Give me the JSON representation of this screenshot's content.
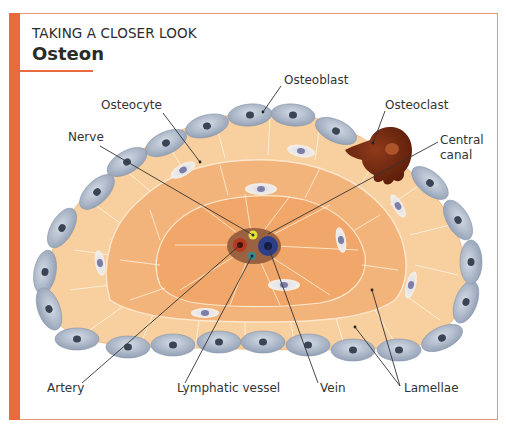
{
  "header": {
    "kicker": "TAKING A CLOSER LOOK",
    "title": "Osteon"
  },
  "colors": {
    "accent": "#ea6a40",
    "frame_border": "#e7957a",
    "outer_lamella": "#f8cf9e",
    "inner_lamella": "#f2ad72",
    "osteoblast": "#b4bfcf",
    "osteoclast": "#7a2d12",
    "nerve": "#e6e23a",
    "artery": "#b53a22",
    "vein": "#2e3f8a",
    "lymphatic": "#3c8a90",
    "canal": "#9a6240"
  },
  "labels": {
    "osteoblast": "Osteoblast",
    "osteocyte": "Osteocyte",
    "osteoclast": "Osteoclast",
    "nerve": "Nerve",
    "central_canal_line1": "Central",
    "central_canal_line2": "canal",
    "artery": "Artery",
    "lymphatic_vessel": "Lymphatic vessel",
    "vein": "Vein",
    "lamellae": "Lamellae"
  }
}
